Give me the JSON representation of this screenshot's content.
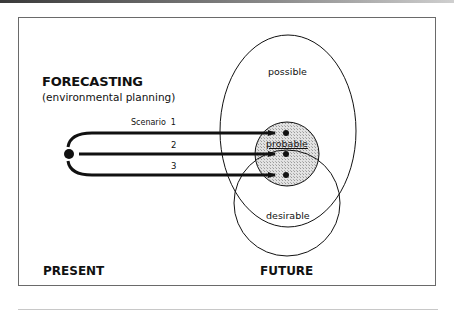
{
  "diagram": {
    "title": "FORECASTING",
    "subtitle": "(environmental planning)",
    "axis_labels": {
      "present": "PRESENT",
      "future": "FUTURE"
    },
    "regions": {
      "possible": "possible",
      "probable": "probable",
      "desirable": "desirable"
    },
    "scenarios": [
      {
        "label": "Scenario  1"
      },
      {
        "label": "2"
      },
      {
        "label": "3"
      }
    ],
    "colors": {
      "stroke": "#111111",
      "probable_fill": "#d4d4d4",
      "frame": "#6a6a6a"
    }
  }
}
